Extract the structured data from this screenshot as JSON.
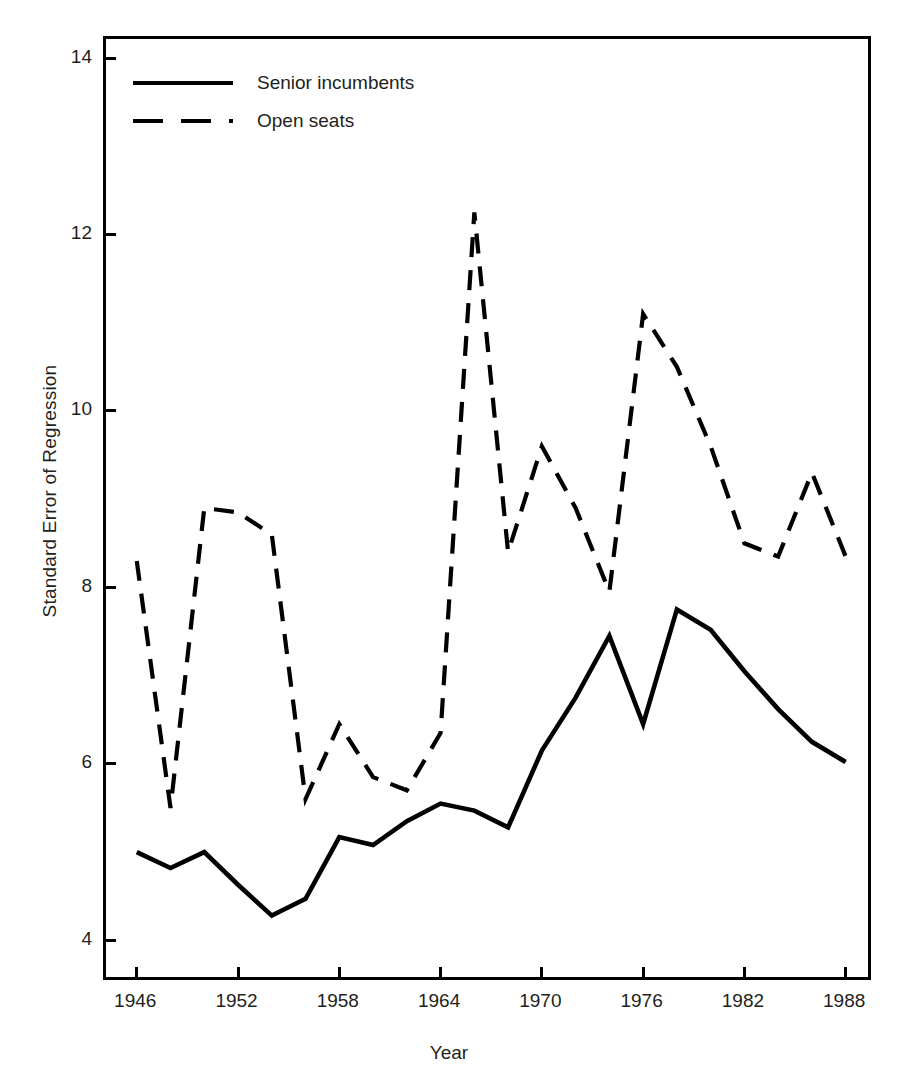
{
  "chart_data": {
    "type": "line",
    "title": "",
    "xlabel": "Year",
    "ylabel": "Standard Error of Regression",
    "xlim": [
      1944,
      1989.5
    ],
    "ylim": [
      3.55,
      14.25
    ],
    "xticks": [
      1946,
      1952,
      1958,
      1964,
      1970,
      1976,
      1982,
      1988
    ],
    "xtick_labels": [
      "1946",
      "1952",
      "1958",
      "1964",
      "1970",
      "1976",
      "1982",
      "1988"
    ],
    "yticks": [
      4,
      6,
      8,
      10,
      12,
      14
    ],
    "ytick_labels": [
      "4",
      "6",
      "8",
      "10",
      "12",
      "14"
    ],
    "grid": false,
    "legend_position": "top-left",
    "x": [
      1946,
      1948,
      1950,
      1952,
      1954,
      1956,
      1958,
      1960,
      1962,
      1964,
      1966,
      1968,
      1970,
      1972,
      1974,
      1976,
      1978,
      1980,
      1982,
      1984,
      1986,
      1988
    ],
    "series": [
      {
        "name": "Senior incumbents",
        "style": "solid",
        "color": "#000000",
        "values": [
          5.0,
          4.82,
          5.0,
          4.63,
          4.28,
          4.47,
          5.17,
          5.08,
          5.35,
          5.55,
          5.47,
          5.28,
          6.15,
          6.75,
          7.45,
          6.45,
          7.75,
          7.52,
          7.05,
          6.62,
          6.25,
          6.02
        ]
      },
      {
        "name": "Open seats",
        "style": "dashed",
        "color": "#000000",
        "values": [
          8.3,
          5.5,
          8.9,
          8.85,
          8.6,
          5.6,
          6.45,
          5.85,
          5.7,
          6.35,
          12.25,
          8.4,
          9.6,
          8.9,
          7.95,
          11.1,
          10.5,
          9.6,
          8.5,
          8.35,
          9.3,
          8.35
        ]
      }
    ]
  },
  "legend": {
    "items": [
      {
        "label": "Senior incumbents",
        "style": "solid"
      },
      {
        "label": "Open seats",
        "style": "dashed"
      }
    ]
  }
}
